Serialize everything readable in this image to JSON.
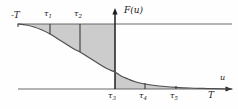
{
  "figure": {
    "name": "cumulative-distribution-style-curve",
    "background_color": "#fefefe",
    "fill_color": "#c9c9c9",
    "line_color": "#4a4a4a",
    "axis_color": "#2b2b2b",
    "curve_color": "#555555"
  },
  "axes": {
    "y_axis_label": "F(u)",
    "x_axis_label": "u",
    "x_axis_y_px": 89,
    "y_axis_x_px": 115,
    "upper_asymptote_y_px": 24
  },
  "labels": {
    "left_endpoint": "-T",
    "right_endpoint": "T",
    "tau": [
      "τ",
      "τ",
      "τ",
      "τ",
      "τ"
    ],
    "tau_subs": [
      "1",
      "2",
      "3",
      "4",
      "5"
    ]
  },
  "ticks": {
    "upper": [
      {
        "id": "tau-1",
        "symbol": "τ",
        "sub": "1",
        "x_px": 50
      },
      {
        "id": "tau-2",
        "symbol": "τ",
        "sub": "2",
        "x_px": 80
      }
    ],
    "lower": [
      {
        "id": "tau-3",
        "symbol": "τ",
        "sub": "3",
        "x_px": 114
      },
      {
        "id": "tau-4",
        "symbol": "τ",
        "sub": "4",
        "x_px": 145
      },
      {
        "id": "tau-5",
        "symbol": "τ",
        "sub": "5",
        "x_px": 176
      }
    ]
  },
  "chart_data": {
    "type": "line",
    "title": "",
    "xlabel": "u",
    "ylabel": "F(u)",
    "grid": false,
    "legend": null,
    "xlim": [
      -1,
      1
    ],
    "ylim": [
      0,
      1
    ],
    "x_tick_labels": [
      "-T",
      "τ₁",
      "τ₂",
      "τ₃",
      "τ₄",
      "τ₅",
      "T"
    ],
    "x_tick_positions_px": [
      18,
      50,
      80,
      115,
      145,
      176,
      215
    ],
    "annotations": [
      "upper horizontal asymptote line",
      "lower horizontal axis line",
      "shaded area between curve and upper asymptote for u < τ₃",
      "shaded area between curve and x-axis for u > τ₃"
    ],
    "series": [
      {
        "name": "F(u)",
        "description": "monotone decreasing sigmoid from upper asymptote to lower axis",
        "x_px": [
          18,
          26,
          34,
          42,
          50,
          58,
          66,
          74,
          80,
          88,
          96,
          104,
          110,
          115,
          121,
          128,
          136,
          145,
          155,
          165,
          176,
          190,
          203,
          215,
          232
        ],
        "y_px": [
          24,
          25,
          27,
          30,
          34,
          39,
          44,
          49,
          52,
          57,
          62,
          67,
          70,
          72,
          76,
          79,
          82,
          84,
          85.5,
          86.5,
          87.3,
          88,
          88.4,
          88.7,
          89
        ]
      }
    ]
  }
}
